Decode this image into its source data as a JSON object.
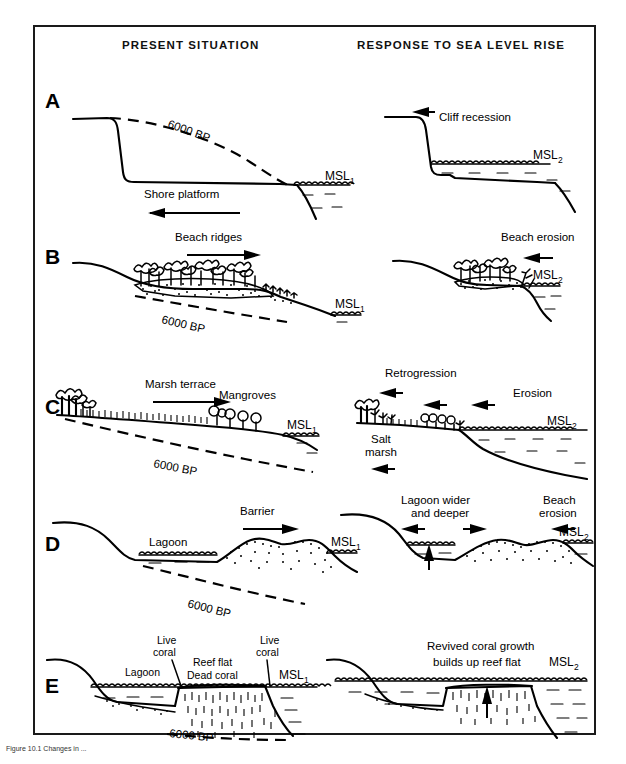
{
  "figure": {
    "headers": {
      "left": "PRESENT  SITUATION",
      "right": "RESPONSE  TO  SEA  LEVEL  RISE"
    },
    "caption": "Figure 10.1  Changes in ...",
    "colors": {
      "ink": "#000000",
      "frame": "#1a1a1a",
      "background": "#ffffff"
    }
  },
  "panels": [
    {
      "id": "A",
      "letter": "A",
      "topic": "cliffed-coast",
      "left": {
        "labels": [
          {
            "name": "bp-line-label",
            "text": "6000 BP"
          },
          {
            "name": "shore-platform-label",
            "text": "Shore platform"
          },
          {
            "name": "msl-label",
            "text": "MSL",
            "sub": "1"
          }
        ],
        "arrows": [
          {
            "name": "shore-platform-arrow",
            "direction": "left"
          }
        ]
      },
      "right": {
        "labels": [
          {
            "name": "cliff-recession-label",
            "text": "Cliff recession"
          },
          {
            "name": "msl-label",
            "text": "MSL",
            "sub": "2"
          }
        ],
        "arrows": [
          {
            "name": "cliff-recession-arrow",
            "direction": "left"
          }
        ]
      }
    },
    {
      "id": "B",
      "letter": "B",
      "topic": "beach-ridge-coast",
      "left": {
        "labels": [
          {
            "name": "beach-ridges-label",
            "text": "Beach ridges"
          },
          {
            "name": "bp-line-label",
            "text": "6000 BP"
          },
          {
            "name": "msl-label",
            "text": "MSL",
            "sub": "1"
          }
        ],
        "arrows": [
          {
            "name": "beach-ridges-arrow",
            "direction": "right"
          }
        ]
      },
      "right": {
        "labels": [
          {
            "name": "beach-erosion-label",
            "text": "Beach erosion"
          },
          {
            "name": "msl-label",
            "text": "MSL",
            "sub": "2"
          }
        ],
        "arrows": [
          {
            "name": "beach-erosion-arrow",
            "direction": "left"
          }
        ]
      }
    },
    {
      "id": "C",
      "letter": "C",
      "topic": "marsh-mangrove-coast",
      "left": {
        "labels": [
          {
            "name": "marsh-terrace-label",
            "text": "Marsh terrace"
          },
          {
            "name": "mangroves-label",
            "text": "Mangroves"
          },
          {
            "name": "bp-line-label",
            "text": "6000 BP"
          },
          {
            "name": "msl-label",
            "text": "MSL",
            "sub": "1"
          }
        ],
        "arrows": [
          {
            "name": "marsh-terrace-arrow",
            "direction": "right"
          }
        ]
      },
      "right": {
        "labels": [
          {
            "name": "retrogression-label",
            "text": "Retrogression"
          },
          {
            "name": "erosion-label",
            "text": "Erosion"
          },
          {
            "name": "salt-marsh-label-line1",
            "text": "Salt"
          },
          {
            "name": "salt-marsh-label-line2",
            "text": "marsh"
          },
          {
            "name": "msl-label",
            "text": "MSL",
            "sub": "2"
          }
        ],
        "arrows": [
          {
            "name": "retrogression-arrow",
            "direction": "left"
          },
          {
            "name": "erosion-arrow-1",
            "direction": "left"
          },
          {
            "name": "erosion-arrow-2",
            "direction": "left"
          },
          {
            "name": "salt-marsh-arrow",
            "direction": "left"
          }
        ]
      }
    },
    {
      "id": "D",
      "letter": "D",
      "topic": "barrier-lagoon-coast",
      "left": {
        "labels": [
          {
            "name": "lagoon-label",
            "text": "Lagoon"
          },
          {
            "name": "barrier-label",
            "text": "Barrier"
          },
          {
            "name": "bp-line-label",
            "text": "6000 BP"
          },
          {
            "name": "msl-label",
            "text": "MSL",
            "sub": "1"
          }
        ],
        "arrows": [
          {
            "name": "barrier-arrow",
            "direction": "right"
          }
        ]
      },
      "right": {
        "labels": [
          {
            "name": "lagoon-wider-label-line1",
            "text": "Lagoon wider"
          },
          {
            "name": "lagoon-wider-label-line2",
            "text": "and deeper"
          },
          {
            "name": "beach-erosion-label-line1",
            "text": "Beach"
          },
          {
            "name": "beach-erosion-label-line2",
            "text": "erosion"
          },
          {
            "name": "msl-label",
            "text": "MSL",
            "sub": "2"
          }
        ],
        "arrows": [
          {
            "name": "lagoon-widening-arrow-left",
            "direction": "left"
          },
          {
            "name": "lagoon-widening-arrow-right",
            "direction": "right"
          },
          {
            "name": "lagoon-deepening-arrow",
            "direction": "up"
          },
          {
            "name": "beach-erosion-arrow",
            "direction": "left"
          }
        ]
      }
    },
    {
      "id": "E",
      "letter": "E",
      "topic": "coral-reef-coast",
      "left": {
        "labels": [
          {
            "name": "lagoon-label",
            "text": "Lagoon"
          },
          {
            "name": "live-coral-label-left-line1",
            "text": "Live"
          },
          {
            "name": "live-coral-label-left-line2",
            "text": "coral"
          },
          {
            "name": "reef-flat-label",
            "text": "Reef flat"
          },
          {
            "name": "dead-coral-label",
            "text": "Dead coral"
          },
          {
            "name": "live-coral-label-right-line1",
            "text": "Live"
          },
          {
            "name": "live-coral-label-right-line2",
            "text": "coral"
          },
          {
            "name": "bp-line-label",
            "text": "6000 BP"
          },
          {
            "name": "msl-label",
            "text": "MSL",
            "sub": "1"
          }
        ],
        "arrows": []
      },
      "right": {
        "labels": [
          {
            "name": "revived-coral-label-line1",
            "text": "Revived coral growth"
          },
          {
            "name": "revived-coral-label-line2",
            "text": "builds up reef flat"
          },
          {
            "name": "msl-label",
            "text": "MSL",
            "sub": "2"
          }
        ],
        "arrows": [
          {
            "name": "reef-growth-arrow",
            "direction": "up"
          }
        ]
      }
    }
  ]
}
